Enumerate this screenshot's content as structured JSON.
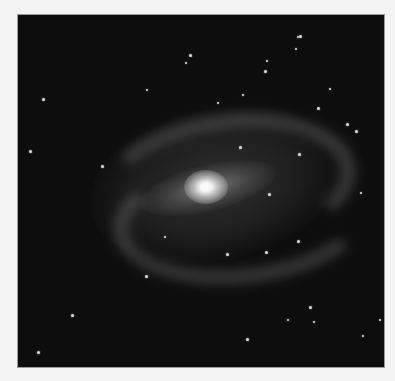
{
  "image": {
    "subject": "barred spiral galaxy",
    "palette": {
      "page_background": "#f3f3f3",
      "sky": "#0d0d0d",
      "core": "#ffffff",
      "arms": "#969696",
      "stars": "#d8d8d8"
    },
    "stars": [
      {
        "x": 172,
        "y": 40,
        "r": 1.5
      },
      {
        "x": 168,
        "y": 48,
        "r": 1
      },
      {
        "x": 249,
        "y": 46,
        "r": 1
      },
      {
        "x": 282,
        "y": 21,
        "r": 1.5
      },
      {
        "x": 280,
        "y": 22,
        "r": 1
      },
      {
        "x": 25,
        "y": 84,
        "r": 1.5
      },
      {
        "x": 12,
        "y": 136,
        "r": 1.5
      },
      {
        "x": 247,
        "y": 56,
        "r": 1.5
      },
      {
        "x": 278,
        "y": 34,
        "r": 1
      },
      {
        "x": 222,
        "y": 132,
        "r": 1.5
      },
      {
        "x": 84,
        "y": 151,
        "r": 1.5
      },
      {
        "x": 129,
        "y": 75,
        "r": 1
      },
      {
        "x": 225,
        "y": 80,
        "r": 1
      },
      {
        "x": 300,
        "y": 93,
        "r": 1.5
      },
      {
        "x": 338,
        "y": 116,
        "r": 1.5
      },
      {
        "x": 281,
        "y": 139,
        "r": 1.5
      },
      {
        "x": 329,
        "y": 109,
        "r": 1.5
      },
      {
        "x": 251,
        "y": 179,
        "r": 1.5
      },
      {
        "x": 280,
        "y": 226,
        "r": 1.5
      },
      {
        "x": 209,
        "y": 239,
        "r": 1.5
      },
      {
        "x": 147,
        "y": 222,
        "r": 1
      },
      {
        "x": 248,
        "y": 237,
        "r": 1.5
      },
      {
        "x": 343,
        "y": 178,
        "r": 1
      },
      {
        "x": 128,
        "y": 261,
        "r": 1.5
      },
      {
        "x": 292,
        "y": 292,
        "r": 1.5
      },
      {
        "x": 296,
        "y": 307,
        "r": 1
      },
      {
        "x": 54,
        "y": 300,
        "r": 1.5
      },
      {
        "x": 229,
        "y": 324,
        "r": 1.5
      },
      {
        "x": 20,
        "y": 337,
        "r": 1.5
      },
      {
        "x": 345,
        "y": 321,
        "r": 1
      },
      {
        "x": 362,
        "y": 305,
        "r": 1
      },
      {
        "x": 200,
        "y": 88,
        "r": 1
      },
      {
        "x": 312,
        "y": 74,
        "r": 1
      },
      {
        "x": 270,
        "y": 305,
        "r": 1
      }
    ]
  }
}
